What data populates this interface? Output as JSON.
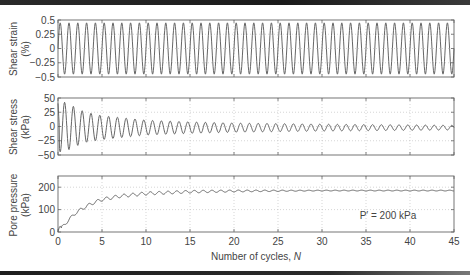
{
  "chart_data": [
    {
      "type": "line",
      "panel": "top",
      "title": "",
      "ylabel": "Shear strain",
      "ylabel_unit": "(%)",
      "xlabel": "",
      "xlim": [
        0,
        45
      ],
      "ylim": [
        -0.5,
        0.5
      ],
      "yticks": [
        0.5,
        0.25,
        0,
        -0.25,
        -0.5
      ],
      "ytick_labels": [
        "0.5",
        "0.25",
        "0",
        "−0.25",
        "−0.5"
      ],
      "xticks": [
        0,
        5,
        10,
        15,
        20,
        25,
        30,
        35,
        40,
        45
      ],
      "grid": "dotted",
      "series": [
        {
          "name": "Shear strain",
          "description": "sinusoidal, 1 cycle per N",
          "amplitude": 0.45,
          "cycles": 45
        }
      ]
    },
    {
      "type": "line",
      "panel": "middle",
      "title": "",
      "ylabel": "Shear stress",
      "ylabel_unit": "(kPa)",
      "xlabel": "",
      "xlim": [
        0,
        45
      ],
      "ylim": [
        -50,
        50
      ],
      "yticks": [
        50,
        25,
        0,
        -25,
        -50
      ],
      "ytick_labels": [
        "50",
        "25",
        "0",
        "−25",
        "−50"
      ],
      "xticks": [
        0,
        5,
        10,
        15,
        20,
        25,
        30,
        35,
        40,
        45
      ],
      "grid": "dotted",
      "series": [
        {
          "name": "Shear stress",
          "description": "decaying oscillation, 1 cycle per N",
          "peak_amplitude_by_N": {
            "N": [
              0,
              1,
              2,
              3,
              5,
              10,
              15,
              20,
              30,
              45
            ],
            "amp": [
              45,
              42,
              34,
              27,
              21,
              13,
              10,
              8,
              6,
              4
            ]
          },
          "center_offset_kPa": -2
        }
      ]
    },
    {
      "type": "line",
      "panel": "bottom",
      "title": "",
      "ylabel": "Pore pressure",
      "ylabel_unit": "(kPa)",
      "xlabel": "Number of cycles, ",
      "xlabel_italic": "N",
      "xlim": [
        0,
        45
      ],
      "ylim": [
        0,
        250
      ],
      "yticks": [
        200,
        100,
        0
      ],
      "ytick_labels": [
        "200",
        "100",
        "0"
      ],
      "xticks": [
        0,
        5,
        10,
        15,
        20,
        25,
        30,
        35,
        40,
        45
      ],
      "xtick_labels": [
        "0",
        "5",
        "10",
        "15",
        "20",
        "25",
        "30",
        "35",
        "40",
        "45"
      ],
      "grid": "dotted",
      "annotation": "P′ = 200 kPa",
      "series": [
        {
          "name": "Pore pressure",
          "description": "rises and saturates with small ripples",
          "x": [
            0,
            1,
            2,
            3,
            4,
            5,
            7,
            10,
            15,
            20,
            25,
            30,
            35,
            40,
            45
          ],
          "y": [
            0,
            45,
            85,
            110,
            130,
            145,
            160,
            172,
            180,
            183,
            184,
            185,
            185,
            185,
            185
          ],
          "ripple_amplitude": 12
        }
      ]
    }
  ],
  "colors": {
    "line": "#555555",
    "axis": "#666666",
    "grid": "#bbbbbb",
    "text": "#444444"
  }
}
